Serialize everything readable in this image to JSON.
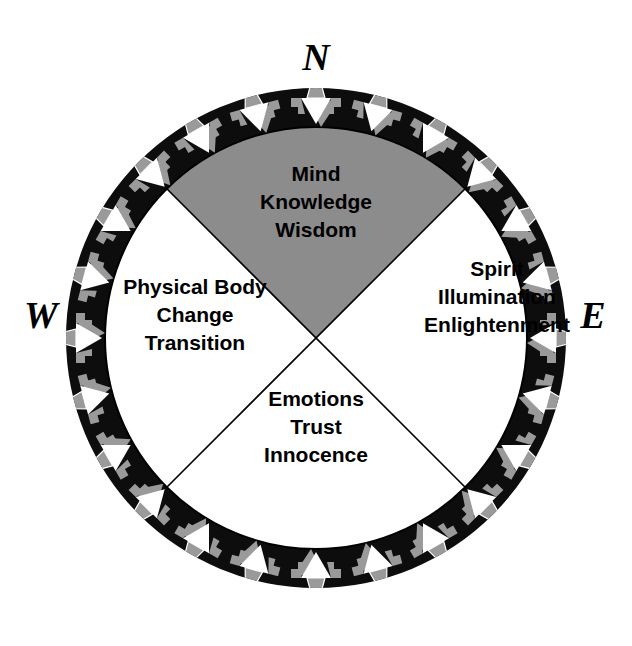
{
  "figure": {
    "background_color": "#ffffff",
    "ring_color": "#0d0d0d",
    "highlight_quadrant_color": "#8c8c8c",
    "plain_quadrant_color": "#ffffff",
    "marker_fill_color": "#ffffff",
    "marker_shadow_color": "#9a9a9a",
    "line_color": "#000000"
  },
  "cardinals": {
    "north": "N",
    "east": "E",
    "south": "S",
    "west": "W"
  },
  "quadrants": [
    {
      "id": "north",
      "direction": "N",
      "shaded": true,
      "fill": "#8c8c8c",
      "lines": [
        "Mind",
        "Knowledge",
        "Wisdom"
      ]
    },
    {
      "id": "east",
      "direction": "E",
      "shaded": false,
      "fill": "#ffffff",
      "lines": [
        "Spirit",
        "Illumination",
        "Enlightenment"
      ]
    },
    {
      "id": "south",
      "direction": "S",
      "shaded": false,
      "fill": "#ffffff",
      "lines": [
        "Emotions",
        "Trust",
        "Innocence"
      ]
    },
    {
      "id": "west",
      "direction": "W",
      "shaded": false,
      "fill": "#ffffff",
      "lines": [
        "Physical Body",
        "Change",
        "Transition"
      ]
    }
  ],
  "ring": {
    "marker_name": "inward-arrow-marker",
    "marker_count": 24,
    "marker_description": "white triangle pointing toward the centre with a grey offset shadow and a small grey trapezoid cap"
  }
}
